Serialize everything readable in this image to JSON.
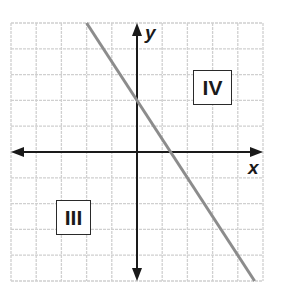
{
  "graph": {
    "x_axis_label": "x",
    "y_axis_label": "y",
    "quadrant_labels": [
      {
        "text": "IV",
        "region": "upper-right"
      },
      {
        "text": "III",
        "region": "lower-left"
      }
    ],
    "grid": {
      "x_min": -5,
      "x_max": 5,
      "y_min": -5,
      "y_max": 5,
      "step": 1
    },
    "line": {
      "slope": -1.5,
      "y_intercept": 2,
      "color": "#8c8c8c"
    },
    "colors": {
      "grid": "#d0d0d0",
      "axis": "#1a1a1a",
      "line": "#8c8c8c"
    }
  },
  "chart_data": {
    "type": "line",
    "title": "",
    "xlabel": "x",
    "ylabel": "y",
    "xlim": [
      -5,
      5
    ],
    "ylim": [
      -5,
      5
    ],
    "grid": true,
    "series": [
      {
        "name": "line",
        "x": [
          -2,
          4.67
        ],
        "y": [
          5,
          -5
        ]
      }
    ],
    "annotations": [
      "IV",
      "III"
    ]
  }
}
